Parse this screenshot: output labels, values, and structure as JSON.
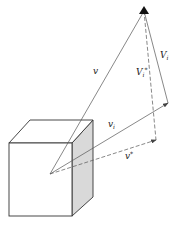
{
  "diagram": {
    "type": "vector-diagram",
    "labels": {
      "v": "v",
      "v_i": "v",
      "v_i_sub": "i",
      "v_star": "v",
      "v_star_sup": "*",
      "V_i": "V",
      "V_i_sub": "i",
      "V_i_star": "V",
      "V_i_star_sub": "i",
      "V_i_star_sup": "*"
    },
    "colors": {
      "line": "#555555",
      "cube_edge": "#333333",
      "cube_side": "#d9d9d9",
      "apex": "#111111"
    }
  }
}
